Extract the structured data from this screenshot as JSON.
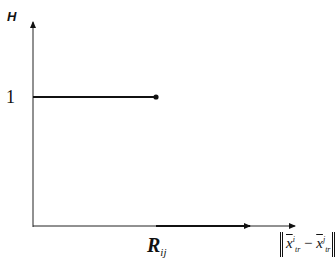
{
  "diagram": {
    "y_axis_label": "H",
    "y_tick_label": "1",
    "x_marker_label": {
      "base": "R",
      "subscript": "ij"
    },
    "x_axis_label": {
      "left_term": {
        "base": "x",
        "superscript": "i",
        "subscript": "tr"
      },
      "operator": "−",
      "right_term": {
        "base": "x",
        "superscript": "j",
        "subscript": "tr"
      }
    },
    "step_function": {
      "level": 1,
      "from": 0,
      "to": "R_ij",
      "endpoint": "closed-dot"
    }
  }
}
